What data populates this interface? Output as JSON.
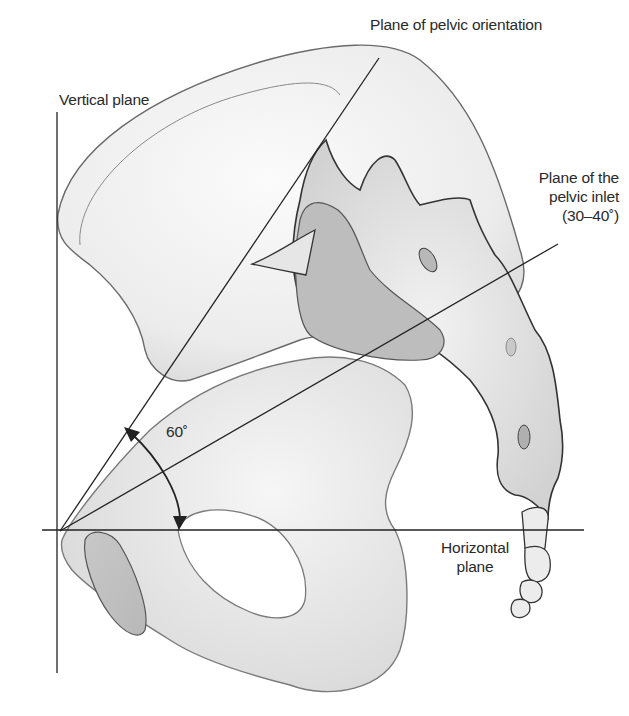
{
  "figure": {
    "labels": {
      "pelvic_orientation": "Plane of pelvic orientation",
      "vertical_plane": "Vertical plane",
      "pelvic_inlet_line1": "Plane of the",
      "pelvic_inlet_line2": "pelvic inlet",
      "pelvic_inlet_angle": "(30–40˚)",
      "angle": "60˚",
      "horizontal_line1": "Horizontal",
      "horizontal_line2": "plane"
    },
    "colors": {
      "bone_fill": "#ececec",
      "bone_shadow": "#cfcfcf",
      "bone_dark": "#b9b9b9",
      "outline": "#4a4a4a",
      "line": "#222222",
      "text": "#2a2a2a"
    },
    "reference_lines": {
      "origin": [
        60,
        531
      ],
      "vertical_plane": {
        "x": 57,
        "y_top": 112,
        "y_bottom": 673
      },
      "horizontal_plane": {
        "y": 530,
        "x_left": 42,
        "x_right": 584
      },
      "plane_of_pelvic_orientation_end": [
        379,
        58
      ],
      "plane_of_pelvic_inlet_end": [
        558,
        244
      ]
    }
  }
}
